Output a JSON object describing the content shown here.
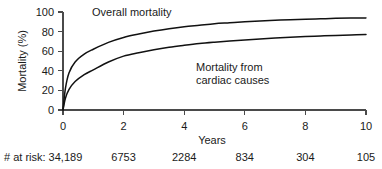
{
  "chart_data": {
    "type": "line",
    "title": "",
    "xlabel": "Years",
    "ylabel": "Mortality (%)",
    "xlim": [
      0,
      10
    ],
    "ylim": [
      0,
      100
    ],
    "xticks": [
      0,
      2,
      4,
      6,
      8,
      10
    ],
    "yticks": [
      0,
      20,
      40,
      60,
      80,
      100
    ],
    "xtick_labels": [
      "0",
      "2",
      "4",
      "6",
      "8",
      "10"
    ],
    "ytick_labels": [
      "0",
      "20",
      "40",
      "60",
      "80",
      "100"
    ],
    "grid": false,
    "legend": "none",
    "annotations": [
      {
        "text": "Overall mortality",
        "x": 1.0,
        "y": 99
      },
      {
        "text": "Mortality from",
        "x": 5.0,
        "y": 46
      },
      {
        "text": "cardiac causes",
        "x": 5.0,
        "y": 36
      }
    ],
    "x": [
      0,
      0.08,
      0.2,
      0.4,
      0.7,
      1.0,
      1.5,
      2.0,
      2.5,
      3.0,
      3.5,
      4.0,
      4.5,
      5.0,
      5.5,
      6.0,
      6.5,
      7.0,
      7.5,
      8.0,
      8.5,
      9.0,
      9.5,
      10
    ],
    "series": [
      {
        "name": "Overall mortality",
        "values": [
          0,
          22,
          38,
          49,
          57,
          62,
          69,
          74,
          77.5,
          80.5,
          83,
          85,
          86.5,
          88,
          89,
          90,
          90.8,
          91.5,
          92.2,
          92.7,
          93.1,
          93.5,
          93.8,
          94
        ]
      },
      {
        "name": "Mortality from cardiac causes",
        "values": [
          0,
          12,
          21,
          29,
          36,
          41,
          49,
          55,
          58.5,
          61.5,
          64,
          66,
          67.8,
          69.2,
          70.4,
          71.5,
          72.5,
          73.4,
          74.2,
          74.9,
          75.5,
          76.1,
          76.6,
          77
        ]
      }
    ],
    "at_risk": {
      "label": "# at risk:",
      "times": [
        0,
        2,
        4,
        6,
        8,
        10
      ],
      "counts": [
        "34,189",
        "6753",
        "2284",
        "834",
        "304",
        "105"
      ]
    }
  },
  "colors": {
    "curve": "#111111",
    "axis": "#4a4a4a",
    "text": "#1a1a1a",
    "background": "#ffffff"
  }
}
